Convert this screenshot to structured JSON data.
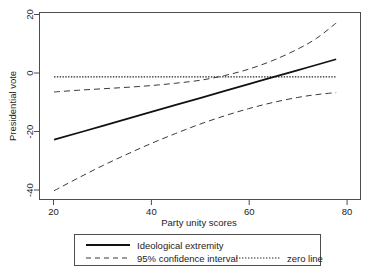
{
  "chart_data": {
    "type": "line",
    "title": "",
    "xlabel": "Party unity scores",
    "ylabel": "Presidential vote",
    "xlim": [
      17,
      83
    ],
    "ylim": [
      -42,
      22
    ],
    "xticks": [
      20,
      40,
      60,
      80
    ],
    "xtick_labels": [
      "20",
      "40",
      "60",
      "80"
    ],
    "yticks": [
      20,
      0,
      -20,
      -40
    ],
    "ytick_labels": [
      "20",
      "0",
      "-20",
      "-40"
    ],
    "grid": false,
    "legend_position": "below-plot",
    "series": [
      {
        "name": "Ideological extremity",
        "style": "solid",
        "x": [
          20,
          30,
          40,
          50,
          60,
          70,
          78
        ],
        "values": [
          -21.5,
          -16.8,
          -12.0,
          -7.3,
          -2.5,
          2.2,
          6.0
        ]
      },
      {
        "name": "95% confidence interval upper",
        "style": "dashed",
        "x": [
          20,
          25,
          30,
          35,
          40,
          45,
          50,
          55,
          60,
          65,
          70,
          74,
          78
        ],
        "values": [
          -5.2,
          -4.6,
          -4.1,
          -3.6,
          -3.0,
          -2.2,
          -1.2,
          0.4,
          2.6,
          5.6,
          9.4,
          13.2,
          18.4
        ]
      },
      {
        "name": "95% confidence interval lower",
        "style": "dashed",
        "x": [
          20,
          25,
          30,
          35,
          40,
          45,
          50,
          55,
          60,
          65,
          70,
          74,
          78
        ],
        "values": [
          -39.0,
          -34.6,
          -30.4,
          -26.5,
          -22.8,
          -19.4,
          -16.2,
          -13.4,
          -10.9,
          -8.8,
          -7.1,
          -6.1,
          -5.4
        ]
      },
      {
        "name": "zero line",
        "style": "dotted",
        "x": [
          20,
          78
        ],
        "values": [
          0,
          0
        ]
      }
    ],
    "legend": [
      {
        "label": "Ideological extremity",
        "style": "solid"
      },
      {
        "label": "95% confidence interval",
        "style": "dashed"
      },
      {
        "label": "zero line",
        "style": "dotted"
      }
    ]
  }
}
